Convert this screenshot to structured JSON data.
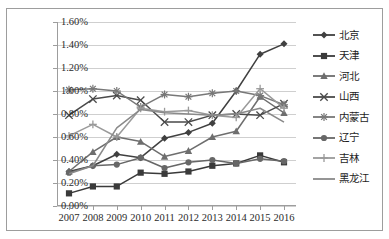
{
  "top_caption_sliver": "",
  "chart_data": {
    "type": "line",
    "title": "",
    "xlabel": "",
    "ylabel": "",
    "ylim": [
      0,
      0.016
    ],
    "y_tick_labels": [
      "0.00%",
      "0.20%",
      "0.40%",
      "0.60%",
      "0.80%",
      "1.00%",
      "1.20%",
      "1.40%",
      "1.60%"
    ],
    "y_tick_values": [
      0.0,
      0.002,
      0.004,
      0.006,
      0.008,
      0.01,
      0.012,
      0.014,
      0.016
    ],
    "grid": true,
    "legend_position": "right",
    "categories": [
      "2007",
      "2008",
      "2009",
      "2010",
      "2011",
      "2012",
      "2013",
      "2014",
      "2015",
      "2016"
    ],
    "x": [
      2007,
      2008,
      2009,
      2010,
      2011,
      2012,
      2013,
      2014,
      2015,
      2016
    ],
    "series": [
      {
        "name": "北京",
        "marker": "diamond",
        "color": "#404040",
        "values": [
          0.003,
          0.0035,
          0.0045,
          0.0042,
          0.0059,
          0.0064,
          0.0072,
          0.01,
          0.0132,
          0.0141
        ]
      },
      {
        "name": "天津",
        "marker": "square",
        "color": "#3a3a3a",
        "values": [
          0.0011,
          0.0017,
          0.0017,
          0.0029,
          0.0028,
          0.003,
          0.0035,
          0.0037,
          0.0044,
          0.0038
        ]
      },
      {
        "name": "河北",
        "marker": "triangle",
        "color": "#6e6e6e",
        "values": [
          0.003,
          0.0047,
          0.006,
          0.0056,
          0.0043,
          0.0048,
          0.006,
          0.0065,
          0.0095,
          0.0081
        ]
      },
      {
        "name": "山西",
        "marker": "cross-x",
        "color": "#4a4a4a",
        "values": [
          0.0079,
          0.0093,
          0.0096,
          0.0092,
          0.0073,
          0.0073,
          0.0079,
          0.008,
          0.0079,
          0.0089
        ]
      },
      {
        "name": "内蒙古",
        "marker": "asterisk",
        "color": "#787878",
        "values": [
          0.0101,
          0.0102,
          0.01,
          0.0086,
          0.0097,
          0.0095,
          0.0098,
          0.01,
          0.0096,
          0.0088
        ]
      },
      {
        "name": "辽宁",
        "marker": "circle",
        "color": "#676767",
        "values": [
          0.0029,
          0.0035,
          0.0036,
          0.0042,
          0.0033,
          0.0038,
          0.004,
          0.0037,
          0.0041,
          0.0039
        ]
      },
      {
        "name": "吉林",
        "marker": "plus",
        "color": "#9a9a9a",
        "values": [
          0.0061,
          0.0071,
          0.006,
          0.0085,
          0.0082,
          0.0083,
          0.0079,
          0.0077,
          0.0102,
          0.0085
        ]
      },
      {
        "name": "黑龙江",
        "marker": "none",
        "color": "#8a8a8a",
        "values": [
          0.0028,
          0.0035,
          0.0068,
          0.0084,
          0.0081,
          0.008,
          0.0079,
          0.008,
          0.0085,
          0.0073
        ]
      }
    ]
  }
}
